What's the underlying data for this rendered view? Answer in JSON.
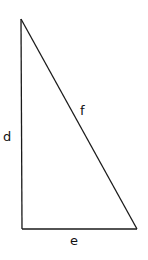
{
  "diagram": {
    "type": "right-triangle",
    "vertices": {
      "top": [
        21,
        19
      ],
      "bottom_left": [
        22,
        229
      ],
      "bottom_right": [
        137,
        229
      ]
    },
    "labels": {
      "vertical_side": "d",
      "hypotenuse": "f",
      "base": "e"
    },
    "stroke_color": "#1a1a1a",
    "background": "#ffffff"
  }
}
